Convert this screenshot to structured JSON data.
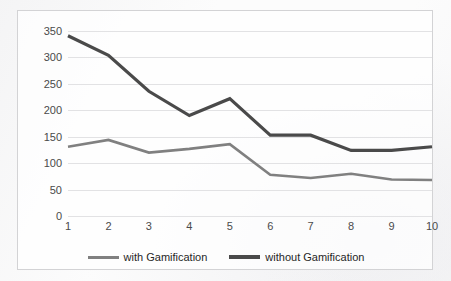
{
  "chart_data": {
    "type": "line",
    "title": "",
    "xlabel": "",
    "ylabel": "",
    "categories": [
      "1",
      "2",
      "3",
      "4",
      "5",
      "6",
      "7",
      "8",
      "9",
      "10"
    ],
    "x": [
      1,
      2,
      3,
      4,
      5,
      6,
      7,
      8,
      9,
      10
    ],
    "ylim": [
      0,
      350
    ],
    "xlim": [
      1,
      10
    ],
    "yticks": [
      0,
      50,
      100,
      150,
      200,
      250,
      300,
      350
    ],
    "ytick_labels": [
      "0",
      "50",
      "100",
      "150",
      "200",
      "250",
      "300",
      "350"
    ],
    "xtick_labels": [
      "1",
      "2",
      "3",
      "4",
      "5",
      "6",
      "7",
      "8",
      "9",
      "10"
    ],
    "grid": "horizontal",
    "legend_position": "bottom",
    "series": [
      {
        "name": "with Gamification",
        "color": "#808080",
        "width": 2.6,
        "values": [
          131,
          144,
          120,
          127,
          136,
          78,
          72,
          80,
          69,
          68
        ]
      },
      {
        "name": "without Gamification",
        "color": "#4a4a4a",
        "width": 3.2,
        "values": [
          341,
          304,
          236,
          190,
          222,
          153,
          153,
          124,
          124,
          131
        ]
      }
    ]
  },
  "legend": {
    "items": [
      {
        "label": "with Gamification",
        "color": "#808080",
        "thickness": 3
      },
      {
        "label": "without Gamification",
        "color": "#4a4a4a",
        "thickness": 4
      }
    ]
  },
  "colors": {
    "with_gamification": "#808080",
    "without_gamification": "#4a4a4a",
    "gridline": "#e2e2e4",
    "border": "#d3d3d5",
    "axis_text": "#4a4a4a",
    "background": "#fcfcfc"
  }
}
